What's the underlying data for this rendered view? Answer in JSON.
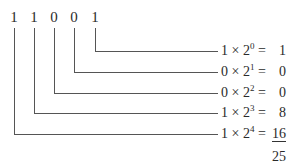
{
  "diagram": {
    "binary_digits": [
      "1",
      "1",
      "0",
      "0",
      "1"
    ],
    "terms": [
      {
        "coef": "1",
        "base": "2",
        "exp": "0",
        "result": "1"
      },
      {
        "coef": "0",
        "base": "2",
        "exp": "1",
        "result": "0"
      },
      {
        "coef": "0",
        "base": "2",
        "exp": "2",
        "result": "0"
      },
      {
        "coef": "1",
        "base": "2",
        "exp": "3",
        "result": "8"
      },
      {
        "coef": "1",
        "base": "2",
        "exp": "4",
        "result": "16"
      }
    ],
    "times_symbol": "×",
    "equals_symbol": "=",
    "total": "25"
  }
}
